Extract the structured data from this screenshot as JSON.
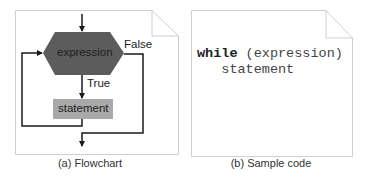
{
  "figure": {
    "panels": [
      {
        "id": "a",
        "caption": "(a) Flowchart",
        "flowchart": {
          "decision_label": "expression",
          "process_label": "statement",
          "true_label": "True",
          "false_label": "False"
        }
      },
      {
        "id": "b",
        "caption": "(b) Sample code",
        "code": {
          "keyword": "while",
          "condition": " (expression)",
          "body": "statement"
        }
      }
    ],
    "colors": {
      "decision_fill": "#5c5c5c",
      "process_fill": "#a9a9a9",
      "line": "#1a1a1a",
      "panel_border": "#cfcfcf"
    }
  }
}
